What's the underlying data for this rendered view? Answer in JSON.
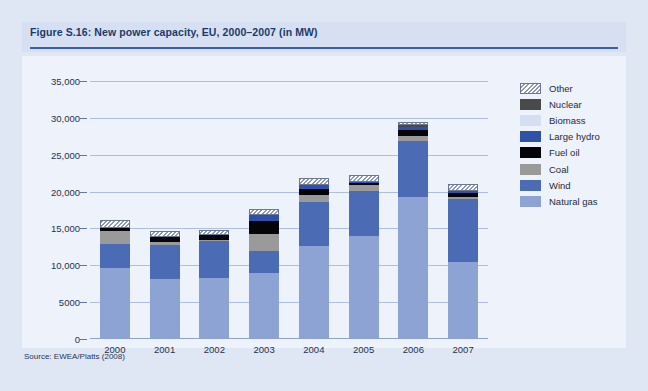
{
  "figure": {
    "title": "Figure S.16: New power capacity, EU, 2000–2007 (in MW)",
    "source": "Source: EWEA/Platts (2008)"
  },
  "colors": {
    "page_background": "#dfe6f4",
    "panel_background": "#eef2fb",
    "title_band": "#d6e0f2",
    "title_text": "#1b3a6b",
    "title_rule": "#3a5fa8",
    "gridline": "#aebedd",
    "natural_gas": "#8da3d4",
    "wind": "#4b6cb5",
    "coal": "#9a9a9a",
    "fuel_oil": "#050509",
    "large_hydro": "#2f52a8",
    "biomass": "#d5dff2",
    "nuclear": "#4a4a4a",
    "other": "#ffffff"
  },
  "chart_data": {
    "type": "bar",
    "stacked": true,
    "title": "Figure S.16: New power capacity, EU, 2000–2007 (in MW)",
    "xlabel": "",
    "ylabel": "",
    "ylim": [
      0,
      35000
    ],
    "yticks": [
      0,
      5000,
      10000,
      15000,
      20000,
      25000,
      30000,
      35000
    ],
    "ytick_labels": [
      "0",
      "5000",
      "10,000",
      "15,000",
      "20,000",
      "25,000",
      "30,000",
      "35,000"
    ],
    "grid": true,
    "legend_position": "right",
    "categories": [
      "2000",
      "2001",
      "2002",
      "2003",
      "2004",
      "2005",
      "2006",
      "2007"
    ],
    "series": [
      {
        "name": "Natural gas",
        "color": "#8da3d4",
        "values": [
          9700,
          8200,
          8300,
          8900,
          12600,
          14000,
          19300,
          10400
        ]
      },
      {
        "name": "Wind",
        "color": "#4b6cb5",
        "values": [
          3200,
          4500,
          5000,
          3000,
          6000,
          6100,
          7600,
          8600
        ]
      },
      {
        "name": "Coal",
        "color": "#9a9a9a",
        "values": [
          1700,
          400,
          200,
          2300,
          900,
          800,
          700,
          300
        ]
      },
      {
        "name": "Fuel oil",
        "color": "#050509",
        "values": [
          500,
          700,
          600,
          1800,
          900,
          200,
          700,
          500
        ]
      },
      {
        "name": "Large hydro",
        "color": "#2f52a8",
        "values": [
          0,
          0,
          0,
          800,
          500,
          200,
          400,
          300
        ]
      },
      {
        "name": "Biomass",
        "color": "#d5dff2",
        "values": [
          0,
          0,
          0,
          0,
          0,
          0,
          0,
          0
        ]
      },
      {
        "name": "Nuclear",
        "color": "#4a4a4a",
        "values": [
          0,
          0,
          0,
          0,
          0,
          0,
          300,
          0
        ]
      },
      {
        "name": "Other",
        "color": "#ffffff",
        "hatched": true,
        "values": [
          1100,
          900,
          700,
          800,
          900,
          1000,
          500,
          900
        ]
      }
    ],
    "totals": [
      16200,
      14700,
      14800,
      17600,
      21800,
      22300,
      29500,
      21000
    ]
  },
  "legend": {
    "items": [
      {
        "label": "Other",
        "color": "#ffffff",
        "hatched": true
      },
      {
        "label": "Nuclear",
        "color": "#4a4a4a",
        "hatched": false
      },
      {
        "label": "Biomass",
        "color": "#d5dff2",
        "hatched": false
      },
      {
        "label": "Large hydro",
        "color": "#2f52a8",
        "hatched": false
      },
      {
        "label": "Fuel oil",
        "color": "#050509",
        "hatched": false
      },
      {
        "label": "Coal",
        "color": "#9a9a9a",
        "hatched": false
      },
      {
        "label": "Wind",
        "color": "#4b6cb5",
        "hatched": false
      },
      {
        "label": "Natural gas",
        "color": "#8da3d4",
        "hatched": false
      }
    ]
  }
}
